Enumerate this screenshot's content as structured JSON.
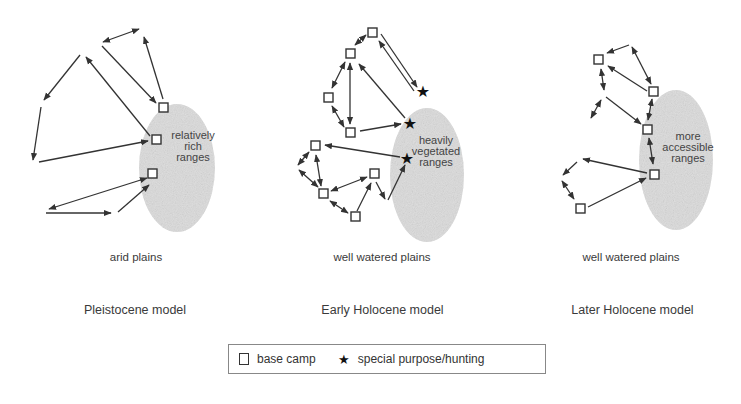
{
  "panels": [
    {
      "id": "pleistocene",
      "range_label": [
        "relatively",
        "rich",
        "ranges"
      ],
      "plains_label": "arid plains",
      "model_label": "Pleistocene model"
    },
    {
      "id": "early-holocene",
      "range_label": [
        "heavily",
        "vegetated",
        "ranges"
      ],
      "plains_label": "well watered plains",
      "model_label": "Early Holocene model"
    },
    {
      "id": "later-holocene",
      "range_label": [
        "more",
        "accessible",
        "ranges"
      ],
      "plains_label": "well watered plains",
      "model_label": "Later Holocene model"
    }
  ],
  "legend": {
    "base_camp_icon": "square-icon",
    "base_camp_label": "base camp",
    "special_icon": "star-icon",
    "special_glyph": "★",
    "special_label": "special purpose/hunting"
  },
  "colors": {
    "stroke": "#333333",
    "range_fill": "#d9d9d9"
  }
}
